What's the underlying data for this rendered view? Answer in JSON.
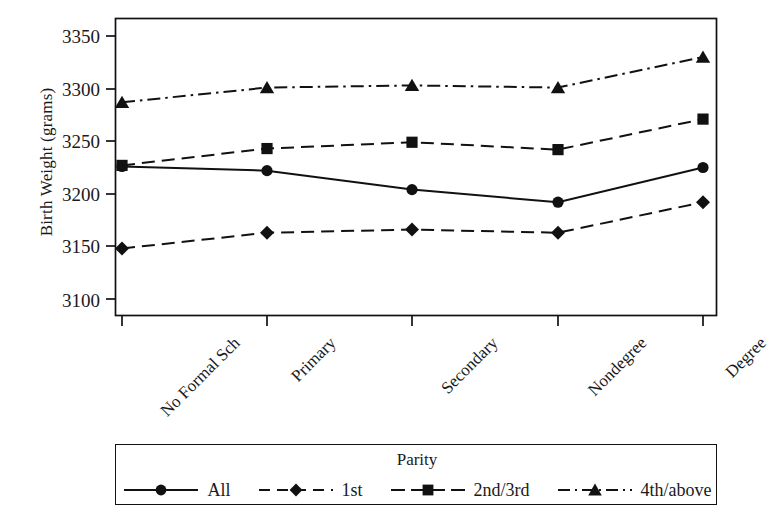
{
  "chart_data": {
    "type": "line",
    "title": "",
    "xlabel": "",
    "ylabel": "Birth Weight (grams)",
    "categories": [
      "No Formal Sch",
      "Primary",
      "Secondary",
      "Nondegree",
      "Degree"
    ],
    "ylim": [
      3100,
      3350
    ],
    "yticks": [
      3100,
      3150,
      3200,
      3250,
      3300,
      3350
    ],
    "ytick_labels": [
      "3100",
      "3150",
      "3200",
      "3250",
      "3300",
      "3350"
    ],
    "grid": false,
    "legend_position": "below-axes",
    "legend_title": "Parity",
    "series": [
      {
        "name": "All",
        "marker": "circle",
        "linestyle": "solid",
        "values": [
          3226,
          3222,
          3204,
          3192,
          3225
        ]
      },
      {
        "name": "1st",
        "marker": "diamond",
        "linestyle": "dashed",
        "values": [
          3148,
          3163,
          3166,
          3163,
          3192
        ]
      },
      {
        "name": "2nd/3rd",
        "marker": "square",
        "linestyle": "dashed",
        "values": [
          3227,
          3243,
          3249,
          3242,
          3271
        ]
      },
      {
        "name": "4th/above",
        "marker": "triangle",
        "linestyle": "dashdot",
        "values": [
          3287,
          3301,
          3303,
          3301,
          3330
        ]
      }
    ]
  },
  "axes": {
    "y_title": "Birth Weight (grams)",
    "y_tick_labels": [
      "3350",
      "3300",
      "3250",
      "3200",
      "3150",
      "3100"
    ],
    "x_tick_labels": [
      "No Formal Sch",
      "Primary",
      "Secondary",
      "Nondegree",
      "Degree"
    ]
  },
  "legend": {
    "title": "Parity",
    "entries": [
      {
        "label": "All",
        "marker": "circle-marker",
        "style": "solid"
      },
      {
        "label": "1st",
        "marker": "diamond-marker",
        "style": "dashed"
      },
      {
        "label": "2nd/3rd",
        "marker": "square-marker",
        "style": "dashed"
      },
      {
        "label": "4th/above",
        "marker": "triangle-marker",
        "style": "dashdot"
      }
    ]
  },
  "style": {
    "ink": "#111111",
    "background": "#ffffff"
  }
}
